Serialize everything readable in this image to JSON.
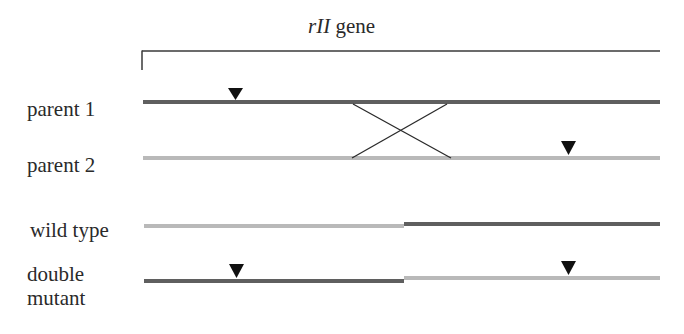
{
  "title": {
    "italic": "rII",
    "rest": " gene"
  },
  "rows": [
    {
      "label": "parent 1"
    },
    {
      "label": "parent 2"
    },
    {
      "label": "wild type"
    },
    {
      "label": "double mutant",
      "line1": "double",
      "line2": "mutant"
    }
  ],
  "colors": {
    "dark": "#5f5f5f",
    "light": "#b9b9b9",
    "black": "#111111"
  }
}
